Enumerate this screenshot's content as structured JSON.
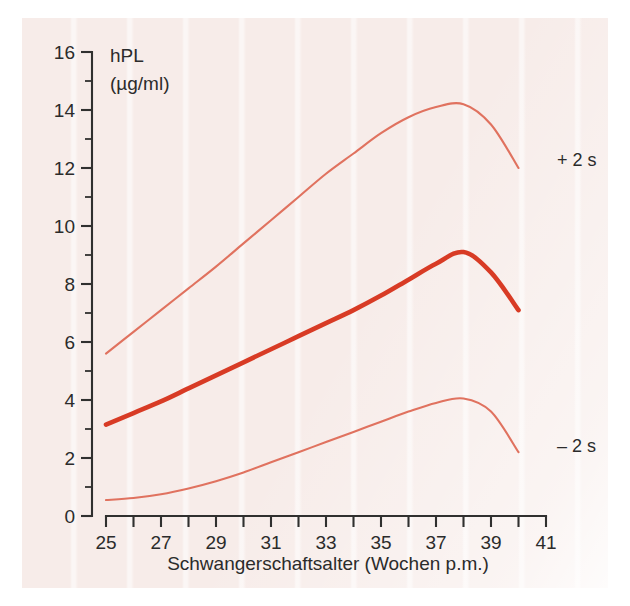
{
  "figure": {
    "background_color": "#f7ece9",
    "page_color": "#ffffff"
  },
  "chart_data": {
    "type": "line",
    "title": "",
    "xlabel": "Schwangerschaftsalter (Wochen p.m.)",
    "ylabel": "hPL",
    "yunit": "(µg/ml)",
    "xlim": [
      25,
      41
    ],
    "ylim": [
      0,
      16
    ],
    "xticks": [
      25,
      26,
      27,
      28,
      29,
      30,
      31,
      32,
      33,
      34,
      35,
      36,
      37,
      38,
      39,
      40,
      41
    ],
    "xticklabels": [
      "25",
      "",
      "27",
      "",
      "29",
      "",
      "31",
      "",
      "33",
      "",
      "35",
      "",
      "37",
      "",
      "39",
      "",
      "41"
    ],
    "xtick_labeled": [
      "25",
      "27",
      "29",
      "31",
      "33",
      "35",
      "37",
      "39",
      "41"
    ],
    "yticks": [
      0,
      1,
      2,
      3,
      4,
      5,
      6,
      7,
      8,
      9,
      10,
      11,
      12,
      13,
      14,
      15,
      16
    ],
    "ytick_labeled": [
      "0",
      "2",
      "4",
      "6",
      "8",
      "10",
      "12",
      "14",
      "16"
    ],
    "grid": false,
    "legend_position": "inline-right",
    "x": [
      25,
      26,
      27,
      28,
      29,
      30,
      31,
      32,
      33,
      34,
      35,
      36,
      37,
      38,
      39,
      40
    ],
    "series": [
      {
        "name": "+ 2 s",
        "label": "+ 2 s",
        "color": "#e0725f",
        "width": "thin",
        "values": [
          5.6,
          6.35,
          7.1,
          7.85,
          8.6,
          9.4,
          10.2,
          11.0,
          11.8,
          12.5,
          13.2,
          13.75,
          14.1,
          14.2,
          13.5,
          12.0
        ]
      },
      {
        "name": "Mittelwert",
        "label": "",
        "color": "#d83b25",
        "width": "thick",
        "values": [
          3.15,
          3.55,
          3.95,
          4.4,
          4.85,
          5.3,
          5.75,
          6.2,
          6.65,
          7.1,
          7.6,
          8.15,
          8.7,
          9.1,
          8.4,
          7.1
        ]
      },
      {
        "name": "- 2 s",
        "label": "– 2 s",
        "color": "#e0725f",
        "width": "thin",
        "values": [
          0.55,
          0.62,
          0.75,
          0.95,
          1.2,
          1.5,
          1.85,
          2.2,
          2.55,
          2.9,
          3.25,
          3.6,
          3.9,
          4.05,
          3.6,
          2.2
        ]
      }
    ],
    "annotations": [
      {
        "text": "+ 2 s",
        "x_px": 557,
        "y_px": 160
      },
      {
        "text": "– 2 s",
        "x_px": 557,
        "y_px": 446
      }
    ]
  }
}
